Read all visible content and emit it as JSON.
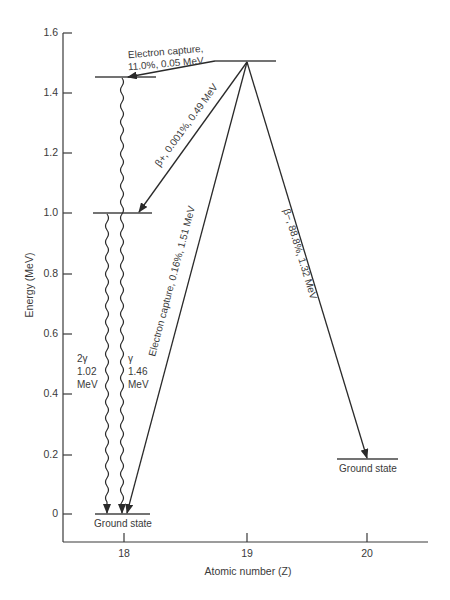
{
  "diagram": {
    "title": "",
    "y_axis": {
      "label": "Energy (MeV)",
      "ticks": [
        "0",
        "0.2",
        "0.4",
        "0.6",
        "0.8",
        "1.0",
        "1.2",
        "1.4",
        "1.6"
      ]
    },
    "x_axis": {
      "label": "Atomic number (Z)",
      "ticks": [
        "18",
        "19",
        "20"
      ]
    },
    "levels": [
      {
        "id": "parent",
        "z": 19,
        "energy_mev": 1.505
      },
      {
        "id": "z18-excited-1.46",
        "z": 18,
        "energy_mev": 1.46
      },
      {
        "id": "z18-level-1.02",
        "z": 18,
        "energy_mev": 1.0
      },
      {
        "id": "z18-ground",
        "z": 18,
        "energy_mev": 0,
        "label": "Ground state"
      },
      {
        "id": "z20-ground",
        "z": 20,
        "energy_mev": 0.185,
        "label": "Ground state"
      }
    ],
    "transitions": [
      {
        "id": "ec-11",
        "line1": "Electron capture,",
        "line2": "11.0%, 0.05 MeV"
      },
      {
        "id": "beta-plus",
        "label": "β+, 0.001%, 0.49 MeV"
      },
      {
        "id": "ec-016",
        "label": "Electron capture, 0.16%, 1.51 MeV"
      },
      {
        "id": "beta-minus",
        "label": "β−, 88.8%, 1.32 MeV"
      },
      {
        "id": "gamma-2",
        "line1": "2γ",
        "line2": "1.02",
        "line3": "MeV"
      },
      {
        "id": "gamma-1",
        "line1": "γ",
        "line2": "1.46",
        "line3": "MeV"
      }
    ],
    "colors": {
      "ink": "#2a2a2a",
      "background": "#ffffff"
    }
  }
}
